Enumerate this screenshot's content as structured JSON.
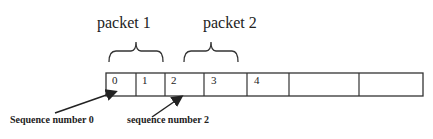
{
  "diagram": {
    "packet_labels": [
      "packet 1",
      "packet 2"
    ],
    "cells": [
      "0",
      "1",
      "2",
      "3",
      "4",
      "",
      ""
    ],
    "captions": {
      "seq0": "Sequence number 0",
      "seq2": "sequence number 2"
    },
    "colors": {
      "stroke": "#333333",
      "text": "#222222",
      "background": "#ffffff"
    }
  }
}
